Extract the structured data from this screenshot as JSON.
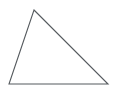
{
  "canvas": {
    "width": 115,
    "height": 97,
    "background_color": "#ffffff"
  },
  "figure": {
    "name": "triangle",
    "type": "polygon",
    "label": "",
    "stroke_color": "#555a5e",
    "fill_color": "none",
    "stroke_width": 1.1,
    "vertex_count": 3,
    "vertices": [
      {
        "name": "apex",
        "x": 34,
        "y": 10
      },
      {
        "name": "bottom-right",
        "x": 108,
        "y": 84
      },
      {
        "name": "bottom-left",
        "x": 9,
        "y": 84
      }
    ],
    "points_attr": "34,10 108,84 9,84",
    "edges": [
      {
        "name": "left-edge",
        "from": "bottom-left",
        "to": "apex"
      },
      {
        "name": "right-edge",
        "from": "apex",
        "to": "bottom-right"
      },
      {
        "name": "base-edge",
        "from": "bottom-left",
        "to": "bottom-right"
      }
    ]
  }
}
